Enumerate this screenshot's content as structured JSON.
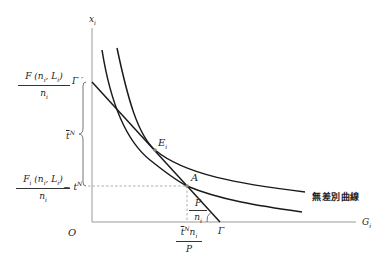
{
  "diagram": {
    "axes": {
      "y_label": "x",
      "y_label_sub": "i",
      "x_label": "G",
      "x_label_sub": "i",
      "origin_label": "O"
    },
    "y_ticks": {
      "upper": {
        "numerator": "F (n",
        "numerator_sub1": "i",
        "numerator_mid": ", L",
        "numerator_sub2": "i",
        "numerator_end": ")",
        "denominator": "n",
        "denominator_sub": "i"
      },
      "lower": {
        "numerator": "F",
        "numerator_sub0": "i",
        "numerator_rest": " (n",
        "numerator_sub1": "i",
        "numerator_mid": ", L",
        "numerator_sub2": "i",
        "numerator_end": ")",
        "denominator": "n",
        "denominator_sub": "i",
        "suffix": "− t",
        "suffix_sup": "N"
      }
    },
    "brace_label": {
      "text": "t",
      "sup": "N"
    },
    "gamma_prime": "Γ ′",
    "gamma": "Γ",
    "point_E": {
      "text": "E",
      "sub": "i"
    },
    "point_A": "A",
    "slope_label": {
      "numerator": "P",
      "denominator": "n",
      "denominator_sub": "i"
    },
    "x_tick": {
      "numerator": "t",
      "numerator_sup": "N",
      "numerator_rest": "n",
      "numerator_sub": "i",
      "denominator": "P"
    },
    "curve_label": "無差別曲線",
    "colors": {
      "line": "#1a1a1a",
      "axis": "#9a9a9a",
      "dashed": "#999999"
    }
  }
}
